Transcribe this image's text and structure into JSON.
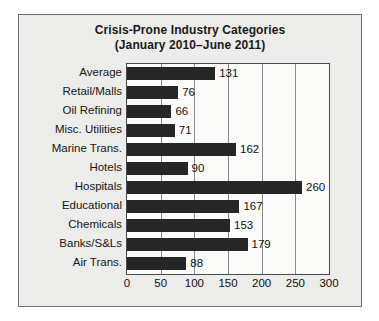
{
  "chart_data": {
    "type": "bar",
    "orientation": "horizontal",
    "title": "Crisis-Prone Industry Categories",
    "subtitle": "(January 2010–June 2011)",
    "xlabel": "",
    "ylabel": "",
    "xlim": [
      0,
      300
    ],
    "xticks": [
      "0",
      "50",
      "100",
      "150",
      "200",
      "250",
      "300"
    ],
    "grid": true,
    "legend": "none",
    "bar_color": "#262626",
    "plot_background": "#fbfbfa",
    "frame_background": "#ececeb",
    "categories": [
      "Average",
      "Retail/Malls",
      "Oil Refining",
      "Misc. Utilities",
      "Marine Trans.",
      "Hotels",
      "Hospitals",
      "Educational",
      "Chemicals",
      "Banks/S&Ls",
      "Air Trans."
    ],
    "values": [
      131,
      76,
      66,
      71,
      162,
      90,
      260,
      167,
      153,
      179,
      88
    ],
    "value_labels": [
      "131",
      "76",
      "66",
      "71",
      "162",
      "90",
      "260",
      "167",
      "153",
      "179",
      "88"
    ]
  }
}
